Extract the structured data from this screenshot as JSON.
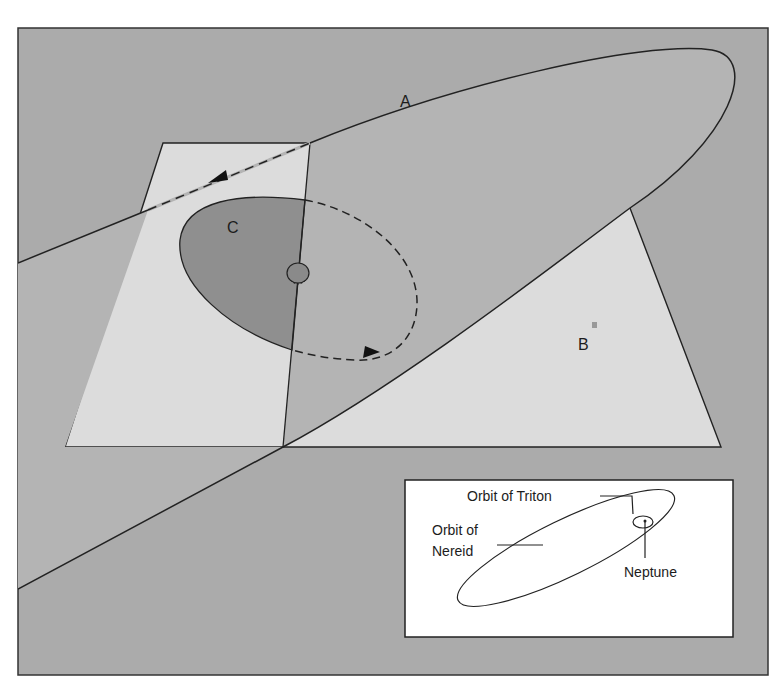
{
  "figure": {
    "colors": {
      "background": "#ababab",
      "plane": "#dcdcdc",
      "ellipse_a_fill": "#b4b4b4",
      "orbit_c_fill": "#8f8f8f",
      "orbit_c_back_fill": "#bdbdbd",
      "planet": "#8a8a8a",
      "line": "#222222",
      "inset_bg": "#ffffff"
    },
    "labels": {
      "a": "A",
      "b": "B",
      "c": "C"
    }
  },
  "inset": {
    "triton_label": "Orbit of Triton",
    "nereid_label_line1": "Orbit of",
    "nereid_label_line2": "Nereid",
    "neptune_label": "Neptune"
  }
}
